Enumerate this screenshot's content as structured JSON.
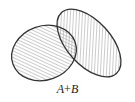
{
  "diagram": {
    "type": "venn",
    "operation": "union",
    "sets": [
      {
        "name": "A",
        "shape": "ellipse",
        "cx": 44,
        "cy": 53,
        "rx": 33,
        "ry": 27,
        "rotate": -20
      },
      {
        "name": "B",
        "shape": "ellipse",
        "cx": 89,
        "cy": 43,
        "rx": 41,
        "ry": 22,
        "rotate": 48
      }
    ],
    "shaded_region": "A ∪ B",
    "fill_pattern": "diagonal-hatch",
    "colors": {
      "stroke": "#333333",
      "hatch": "#9a9a9a",
      "background": "#ffffff"
    },
    "caption": {
      "a": "A",
      "op": "+",
      "b": "B"
    }
  }
}
